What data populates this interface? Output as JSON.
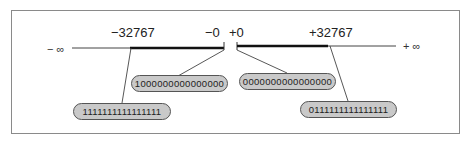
{
  "diagram": {
    "title": "",
    "axis": {
      "neg_infinity": "− ∞",
      "pos_infinity": "+ ∞"
    },
    "tick_labels": [
      {
        "id": "min_neg",
        "text": "−32767"
      },
      {
        "id": "neg_zero",
        "text": "−0"
      },
      {
        "id": "pos_zero",
        "text": "+0"
      },
      {
        "id": "max_pos",
        "text": "+32767"
      }
    ],
    "bit_patterns": [
      {
        "id": "neg_zero_bits",
        "value": "1000000000000000",
        "points_to": "−0"
      },
      {
        "id": "pos_zero_bits",
        "value": "0000000000000000",
        "points_to": "+0"
      },
      {
        "id": "min_neg_bits",
        "value": "1111111111111111",
        "points_to": "−32767"
      },
      {
        "id": "max_pos_bits",
        "value": "0111111111111111",
        "points_to": "+32767"
      }
    ],
    "colors": {
      "frame": "#8a8a8a",
      "pill_fill": "#c9c9c9",
      "pill_border": "#555555",
      "line": "#222222"
    }
  }
}
